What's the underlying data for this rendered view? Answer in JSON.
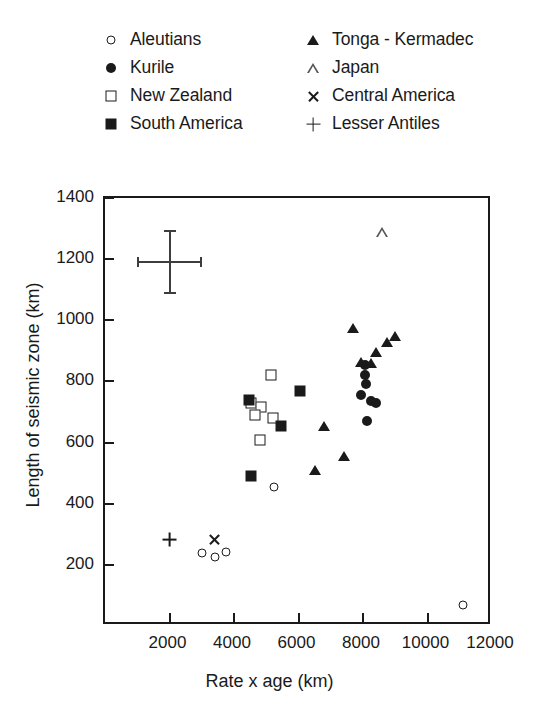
{
  "chart_data": {
    "type": "scatter",
    "title": "",
    "xlabel": "Rate x age (km)",
    "ylabel": "Length of seismic zone (km)",
    "xlim": [
      0,
      12000
    ],
    "ylim": [
      0,
      1400
    ],
    "xticks": [
      2000,
      4000,
      6000,
      8000,
      10000,
      12000
    ],
    "yticks": [
      200,
      400,
      600,
      800,
      1000,
      1200,
      1400
    ],
    "grid": false,
    "legend_position": "above-plot",
    "error_bar": {
      "x": 2000,
      "y": 1190,
      "x_error": 1000,
      "y_error": 105
    },
    "series": [
      {
        "name": "Aleutians",
        "marker": "open-circle",
        "points": [
          {
            "x": 3000,
            "y": 240
          },
          {
            "x": 3400,
            "y": 225
          },
          {
            "x": 3750,
            "y": 243
          },
          {
            "x": 5250,
            "y": 455
          },
          {
            "x": 11100,
            "y": 70
          }
        ]
      },
      {
        "name": "Kurile",
        "marker": "filled-circle",
        "points": [
          {
            "x": 8050,
            "y": 855
          },
          {
            "x": 8050,
            "y": 820
          },
          {
            "x": 8080,
            "y": 790
          },
          {
            "x": 7950,
            "y": 755
          },
          {
            "x": 8250,
            "y": 735
          },
          {
            "x": 8400,
            "y": 730
          },
          {
            "x": 8120,
            "y": 670
          }
        ]
      },
      {
        "name": "New Zealand",
        "marker": "open-square",
        "points": [
          {
            "x": 5150,
            "y": 820
          },
          {
            "x": 4520,
            "y": 730
          },
          {
            "x": 4830,
            "y": 715
          },
          {
            "x": 4650,
            "y": 690
          },
          {
            "x": 5200,
            "y": 680
          },
          {
            "x": 4800,
            "y": 610
          }
        ]
      },
      {
        "name": "South America",
        "marker": "filled-square",
        "points": [
          {
            "x": 4480,
            "y": 740
          },
          {
            "x": 6050,
            "y": 770
          },
          {
            "x": 5450,
            "y": 655
          },
          {
            "x": 4530,
            "y": 490
          }
        ]
      },
      {
        "name": "Tonga - Kermadec",
        "marker": "filled-triangle",
        "points": [
          {
            "x": 7700,
            "y": 975
          },
          {
            "x": 8750,
            "y": 930
          },
          {
            "x": 9000,
            "y": 950
          },
          {
            "x": 8400,
            "y": 895
          },
          {
            "x": 7950,
            "y": 865
          },
          {
            "x": 8250,
            "y": 860
          },
          {
            "x": 6800,
            "y": 655
          },
          {
            "x": 7400,
            "y": 555
          },
          {
            "x": 6500,
            "y": 510
          }
        ]
      },
      {
        "name": "Japan",
        "marker": "open-triangle",
        "points": [
          {
            "x": 8600,
            "y": 1290
          }
        ]
      },
      {
        "name": "Central America",
        "marker": "cross-x",
        "points": [
          {
            "x": 3400,
            "y": 283
          }
        ]
      },
      {
        "name": "Lesser Antiles",
        "marker": "plus",
        "points": [
          {
            "x": 2000,
            "y": 283
          }
        ]
      }
    ]
  },
  "legend": {
    "columns": [
      {
        "entries": [
          {
            "label": "Aleutians",
            "marker": "open-circle"
          },
          {
            "label": "Kurile",
            "marker": "filled-circle"
          },
          {
            "label": "New Zealand",
            "marker": "open-square"
          },
          {
            "label": "South America",
            "marker": "filled-square"
          }
        ]
      },
      {
        "entries": [
          {
            "label": "Tonga - Kermadec",
            "marker": "filled-triangle"
          },
          {
            "label": "Japan",
            "marker": "open-triangle"
          },
          {
            "label": "Central America",
            "marker": "cross-x"
          },
          {
            "label": "Lesser Antiles",
            "marker": "plus"
          }
        ]
      }
    ]
  },
  "style": {
    "ink": "#1a1a1a",
    "background": "#ffffff"
  }
}
